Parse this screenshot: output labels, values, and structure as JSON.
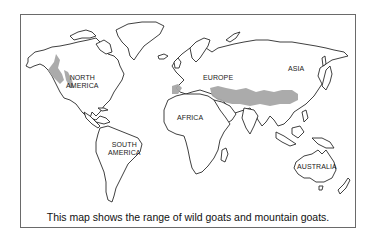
{
  "map": {
    "title_caption": "This map shows the range of wild goats and mountain goats.",
    "range_color": "#a6a6a6",
    "labels": {
      "north_america_1": "NORTH",
      "north_america_2": "AMERICA",
      "south_america_1": "SOUTH",
      "south_america_2": "AMERICA",
      "europe": "EUROPE",
      "asia": "ASIA",
      "africa": "AFRICA",
      "australia": "AUSTRALIA"
    }
  }
}
